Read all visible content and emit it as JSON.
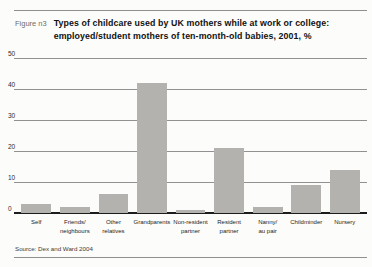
{
  "figure": {
    "label": "Figure n3",
    "title": "Types of childcare used by UK mothers while at work or college:\nemployed/student mothers of ten-month-old babies, 2001, %",
    "source": "Source: Dex and Ward 2004"
  },
  "chart_data": {
    "type": "bar",
    "title": "Types of childcare used by UK mothers while at work or college: employed/student mothers of ten-month-old babies, 2001, %",
    "categories": [
      "Self",
      "Friends/neighbours",
      "Other relatives",
      "Grandparents",
      "Non-resident partner",
      "Resident partner",
      "Nanny/au pair",
      "Childminder",
      "Nursery"
    ],
    "values": [
      3,
      2,
      6,
      42,
      1,
      21,
      2,
      9,
      14
    ],
    "x_tick_labels": [
      "Self",
      "Friends/\nneighbours",
      "Other\nrelatives",
      "Grandparents",
      "Non-resident\npartner",
      "Resident\npartner",
      "Nanny/\nau pair",
      "Childminder",
      "Nursery"
    ],
    "xlabel": "",
    "ylabel": "",
    "ylim": [
      0,
      50
    ],
    "y_ticks": [
      50,
      40,
      30,
      20,
      10,
      0
    ],
    "grid": "horizontal",
    "legend": "none",
    "bar_color": "#b4b2af",
    "gridline_color": "#919191",
    "axis_color": "#1c1c1c"
  }
}
